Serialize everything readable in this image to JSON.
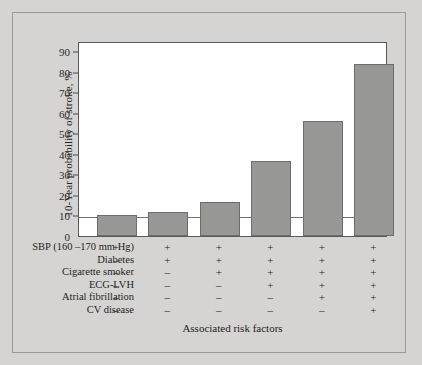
{
  "chart_data": {
    "type": "bar",
    "title": "",
    "xlabel": "Associated risk factors",
    "ylabel": "10-Year probability of stroke, %",
    "ylim": [
      0,
      95
    ],
    "yticks": [
      0,
      10,
      20,
      30,
      40,
      50,
      60,
      70,
      80,
      90
    ],
    "grid": false,
    "legend": null,
    "reference_line": 10,
    "categories": [
      "1",
      "2",
      "3",
      "4",
      "5",
      "6"
    ],
    "values": [
      10,
      11.5,
      16.5,
      36.5,
      56,
      84
    ],
    "bar_color": "#979796",
    "bar_edge_color": "#6d6d6d",
    "plot_background": "#ffffff",
    "figure_background": "#d5d4d2",
    "risk_factor_rows": [
      {
        "label": "SBP (160 –170 mm Hg)",
        "values": [
          "+",
          "+",
          "+",
          "+",
          "+",
          "+"
        ]
      },
      {
        "label": "Diabetes",
        "values": [
          "–",
          "+",
          "+",
          "+",
          "+",
          "+"
        ]
      },
      {
        "label": "Cigarette smoker",
        "values": [
          "–",
          "–",
          "+",
          "+",
          "+",
          "+"
        ]
      },
      {
        "label": "ECG-LVH",
        "values": [
          "–",
          "–",
          "–",
          "+",
          "+",
          "+"
        ]
      },
      {
        "label": "Atrial fibrillation",
        "values": [
          "–",
          "–",
          "–",
          "–",
          "+",
          "+"
        ]
      },
      {
        "label": "CV disease",
        "values": [
          "–",
          "–",
          "–",
          "–",
          "–",
          "+"
        ]
      }
    ]
  }
}
